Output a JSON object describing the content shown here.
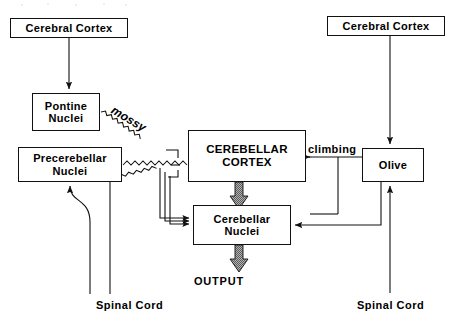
{
  "diagram": {
    "boxes": {
      "cerebral_cortex_left": {
        "line1": "Cerebral Cortex"
      },
      "cerebral_cortex_right": {
        "line1": "Cerebral Cortex"
      },
      "pontine_nuclei": {
        "line1": "Pontine",
        "line2": "Nuclei"
      },
      "precerebellar_nuclei": {
        "line1": "Precerebellar",
        "line2": "Nuclei"
      },
      "cerebellar_cortex": {
        "line1": "CEREBELLAR",
        "line2": "CORTEX"
      },
      "cerebellar_nuclei": {
        "line1": "Cerebellar",
        "line2": "Nuclei"
      },
      "olive": {
        "line1": "Olive"
      }
    },
    "labels": {
      "mossy": "mossy",
      "climbing": "climbing",
      "output": "OUTPUT",
      "spinal_cord_left": "Spinal Cord",
      "spinal_cord_right": "Spinal Cord"
    },
    "colors": {
      "stroke": "#111111",
      "background": "#ffffff",
      "thick_arrow_fill": "#8a8a8a",
      "thick_arrow_edge": "#111111"
    },
    "connections": [
      {
        "from": "cerebral_cortex_left",
        "to": "pontine_nuclei",
        "style": "straight-arrow"
      },
      {
        "from": "pontine_nuclei",
        "to": "cerebellar_cortex",
        "style": "wavy-arrow",
        "label": "mossy"
      },
      {
        "from": "precerebellar_nuclei",
        "to": "cerebellar_cortex",
        "style": "wavy-arrow",
        "label": "mossy"
      },
      {
        "from": "spinal_cord_left",
        "to": "precerebellar_nuclei",
        "style": "curved-arrow"
      },
      {
        "from": "spinal_cord_left",
        "to": "cerebellar_cortex",
        "style": "wavy-arrow"
      },
      {
        "from": "cerebral_cortex_right",
        "to": "olive",
        "style": "straight-arrow"
      },
      {
        "from": "spinal_cord_right",
        "to": "olive",
        "style": "straight-arrow"
      },
      {
        "from": "olive",
        "to": "cerebellar_cortex",
        "style": "straight-arrow",
        "label": "climbing"
      },
      {
        "from": "olive",
        "to": "cerebellar_nuclei",
        "style": "branch-arrow"
      },
      {
        "from": "cerebellar_cortex",
        "to": "cerebellar_nuclei",
        "style": "thick-shaded-arrow"
      },
      {
        "from": "mossy_collaterals",
        "to": "cerebellar_nuclei",
        "style": "triple-line-arrow"
      },
      {
        "from": "cerebellar_nuclei",
        "to": "output",
        "style": "thick-shaded-arrow"
      }
    ]
  }
}
